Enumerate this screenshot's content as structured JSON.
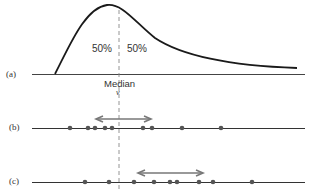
{
  "diagram": {
    "panel_a": {
      "label": "(a)",
      "left_pct": "50%",
      "right_pct": "50%",
      "median_label": "Median",
      "median_symbol": "ν"
    },
    "panel_b": {
      "label": "(b)",
      "dots_x": [
        70,
        88,
        95,
        105,
        112,
        143,
        152,
        182,
        221
      ],
      "arrow": {
        "x1": 96,
        "x2": 150,
        "direction": "double"
      }
    },
    "panel_c": {
      "label": "(c)",
      "dots_x": [
        85,
        109,
        134,
        154,
        170,
        177,
        199,
        213,
        252
      ],
      "arrow": {
        "x1": 138,
        "x2": 202,
        "direction": "double"
      }
    },
    "colors": {
      "curve": "#1a1a1a",
      "axis": "#333333",
      "dot": "#555555",
      "arrow": "#777777",
      "median_line": "#888888"
    }
  }
}
